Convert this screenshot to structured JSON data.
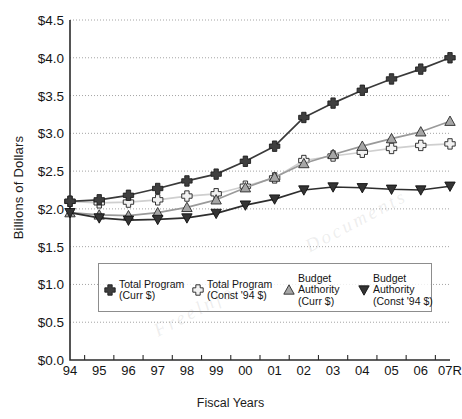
{
  "chart_data": {
    "type": "line",
    "title": "",
    "xlabel": "Fiscal Years",
    "ylabel": "Billions of Dollars",
    "categories": [
      "94",
      "95",
      "96",
      "97",
      "98",
      "99",
      "00",
      "01",
      "02",
      "03",
      "04",
      "05",
      "06",
      "07R"
    ],
    "ylim": [
      0.0,
      4.5
    ],
    "ytick_values": [
      0.0,
      0.5,
      1.0,
      1.5,
      2.0,
      2.5,
      3.0,
      3.5,
      4.0,
      4.5
    ],
    "ytick_labels": [
      "$0.0",
      "$0.5",
      "$1.0",
      "$1.5",
      "$2.0",
      "$2.5",
      "$3.0",
      "$3.5",
      "$4.0",
      "$4.5"
    ],
    "grid": true,
    "legend_position": "inside-lower-center",
    "series": [
      {
        "name": "Total Program (Curr $)",
        "name_line1": "Total Program",
        "name_line2": "(Curr $)",
        "marker": "cross-filled-dark",
        "color": "#3a3a3a",
        "values": [
          2.1,
          2.12,
          2.18,
          2.27,
          2.37,
          2.46,
          2.63,
          2.83,
          3.21,
          3.4,
          3.57,
          3.72,
          3.85,
          4.0
        ]
      },
      {
        "name": "Total Program (Const '94 $)",
        "name_line1": "Total Program",
        "name_line2": "(Const '94 $)",
        "marker": "cross-hollow-light",
        "color": "#cfcfcf",
        "values": [
          2.1,
          2.08,
          2.09,
          2.12,
          2.17,
          2.2,
          2.3,
          2.41,
          2.64,
          2.7,
          2.75,
          2.8,
          2.84,
          2.86
        ]
      },
      {
        "name": "Budget Authority (Curr $)",
        "name_line1": "Budget",
        "name_line2": "Authority",
        "name_line3": "(Curr $)",
        "marker": "triangle-up-gray",
        "color": "#9a9a9a",
        "values": [
          1.95,
          1.92,
          1.91,
          1.95,
          2.02,
          2.12,
          2.28,
          2.42,
          2.6,
          2.72,
          2.83,
          2.93,
          3.02,
          3.16
        ]
      },
      {
        "name": "Budget Authority (Const '94 $)",
        "name_line1": "Budget",
        "name_line2": "Authority",
        "name_line3": "(Const '94 $)",
        "marker": "triangle-down-dark",
        "color": "#2e2e2e",
        "values": [
          1.95,
          1.88,
          1.85,
          1.86,
          1.88,
          1.94,
          2.05,
          2.13,
          2.25,
          2.29,
          2.28,
          2.26,
          2.25,
          2.3
        ]
      }
    ],
    "legend_entries": [
      {
        "label_line1": "Total Program",
        "label_line2": "(Curr $)",
        "marker": "cross-filled-dark"
      },
      {
        "label_line1": "Total Program",
        "label_line2": "(Const '94 $)",
        "marker": "cross-hollow-light"
      },
      {
        "label_line1": "Budget",
        "label_line2": "Authority",
        "label_line3": "(Curr $)",
        "marker": "triangle-up-gray"
      },
      {
        "label_line1": "Budget",
        "label_line2": "Authority",
        "label_line3": "(Const '94 $)",
        "marker": "triangle-down-dark"
      }
    ]
  },
  "colors": {
    "axis": "#2b2b2b",
    "grid": "#9a9a9a",
    "background": "#ffffff",
    "series_total_curr": "#3a3a3a",
    "series_total_const": "#cfcfcf",
    "series_ba_curr": "#9a9a9a",
    "series_ba_const": "#2e2e2e"
  }
}
